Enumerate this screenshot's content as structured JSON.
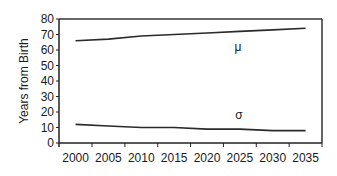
{
  "chart_data": {
    "type": "line",
    "title": "",
    "xlabel": "",
    "ylabel": "Years from Birth",
    "ylim": [
      0,
      80
    ],
    "yticks": [
      0,
      10,
      20,
      30,
      40,
      50,
      60,
      70,
      80
    ],
    "categories": [
      "2000",
      "2005",
      "2010",
      "2015",
      "2020",
      "2025",
      "2030",
      "2035"
    ],
    "series": [
      {
        "name": "μ",
        "values": [
          66,
          67,
          69,
          70,
          71,
          72,
          73,
          74
        ]
      },
      {
        "name": "σ",
        "values": [
          12,
          11,
          10,
          10,
          9,
          9,
          8,
          8
        ]
      }
    ],
    "annotations": [
      {
        "text": "μ",
        "near": "2025"
      },
      {
        "text": "σ",
        "near": "2025"
      }
    ],
    "grid": false,
    "legend": "none (inline labels)"
  },
  "labels": {
    "ylabel": "Years from Birth",
    "mu": "μ",
    "sigma": "σ"
  }
}
